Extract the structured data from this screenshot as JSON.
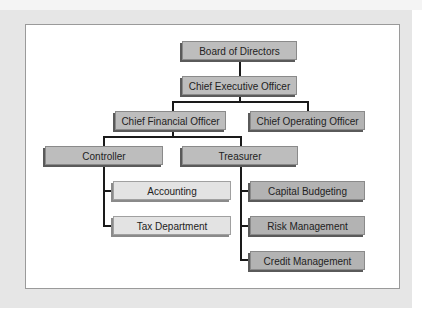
{
  "chart": {
    "title": "",
    "nodes": {
      "board": "Board of Directors",
      "ceo": "Chief Executive Officer",
      "cfo": "Chief Financial Officer",
      "coo": "Chief Operating Officer",
      "controller": "Controller",
      "treasurer": "Treasurer",
      "accounting": "Accounting",
      "tax": "Tax Department",
      "capital_budgeting": "Capital Budgeting",
      "risk_management": "Risk Management",
      "credit_management": "Credit Management"
    },
    "hierarchy": [
      {
        "parent": "Board of Directors",
        "children": [
          "Chief Executive Officer"
        ]
      },
      {
        "parent": "Chief Executive Officer",
        "children": [
          "Chief Financial Officer",
          "Chief Operating Officer"
        ]
      },
      {
        "parent": "Chief Financial Officer",
        "children": [
          "Controller",
          "Treasurer"
        ]
      },
      {
        "parent": "Controller",
        "children": [
          "Accounting",
          "Tax Department"
        ]
      },
      {
        "parent": "Treasurer",
        "children": [
          "Capital Budgeting",
          "Risk Management",
          "Credit Management"
        ]
      }
    ],
    "colors": {
      "box_fill": "#bdbdbd",
      "box_fill_light": "#e3e3e3",
      "box_shadow": "#5a5a5a",
      "connector": "#1a1a1a",
      "panel_bg": "#ffffff",
      "outer_bg": "#e6e6e6"
    }
  }
}
